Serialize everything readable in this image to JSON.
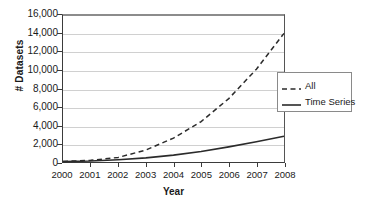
{
  "chart_data": {
    "type": "line",
    "title": "",
    "xlabel": "Year",
    "ylabel": "# Datasets",
    "x": [
      2000,
      2001,
      2002,
      2003,
      2004,
      2005,
      2006,
      2007,
      2008
    ],
    "xtick_labels": [
      "2000",
      "2001",
      "2002",
      "2003",
      "2004",
      "2005",
      "2006",
      "2007",
      "2008"
    ],
    "ytick_labels": [
      "16,000",
      "14,000",
      "12,000",
      "10,000",
      "8,000",
      "6,000",
      "4,000",
      "2,000",
      "0"
    ],
    "ytick_values": [
      16000,
      14000,
      12000,
      10000,
      8000,
      6000,
      4000,
      2000,
      0
    ],
    "xlim": [
      2000,
      2008
    ],
    "ylim": [
      0,
      16000
    ],
    "grid": true,
    "legend_position": "right",
    "series": [
      {
        "name": "All",
        "style": "dashed",
        "color": "#2b2b2b",
        "values": [
          60,
          180,
          500,
          1300,
          2600,
          4400,
          6900,
          10100,
          14000
        ]
      },
      {
        "name": "Time Series",
        "style": "solid",
        "color": "#2b2b2b",
        "values": [
          40,
          110,
          250,
          450,
          750,
          1150,
          1650,
          2200,
          2800
        ]
      }
    ]
  },
  "legend": {
    "items": [
      {
        "label": "All",
        "style": "dashed"
      },
      {
        "label": "Time Series",
        "style": "solid"
      }
    ]
  },
  "colors": {
    "axis": "#3b3b3b",
    "grid": "#d0d0d0",
    "line": "#2b2b2b",
    "text": "#1a1a1a",
    "background": "#ffffff"
  }
}
